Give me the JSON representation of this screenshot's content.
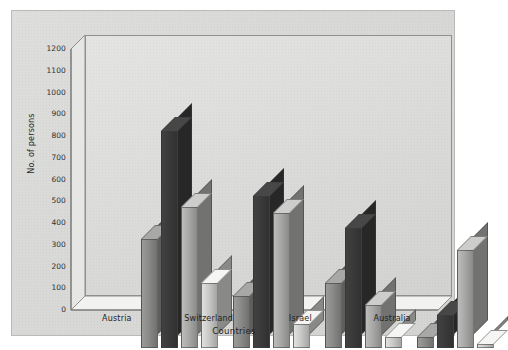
{
  "chart_data": {
    "type": "bar",
    "title": "",
    "xlabel": "Countries",
    "ylabel": "No. of persons",
    "categories": [
      "Austria",
      "Switzerland",
      "Israel",
      "Australia"
    ],
    "series": [
      {
        "name": "series-1",
        "color": "#8a8a88",
        "values": [
          500,
          240,
          300,
          50
        ]
      },
      {
        "name": "series-2",
        "color": "#3a3a3a",
        "values": [
          1000,
          700,
          550,
          150
        ]
      },
      {
        "name": "series-3",
        "color": "#a8a8a6",
        "values": [
          650,
          620,
          200,
          450
        ]
      },
      {
        "name": "series-4",
        "color": "#c9c9c7",
        "values": [
          300,
          110,
          50,
          20
        ]
      }
    ],
    "ylim": [
      0,
      1200
    ],
    "yticks": [
      0,
      100,
      200,
      300,
      400,
      500,
      600,
      700,
      800,
      900,
      1000,
      1100,
      1200
    ],
    "ytick_labels": [
      "0",
      "100",
      "200",
      "300",
      "400",
      "500",
      "600",
      "700",
      "800",
      "900",
      "1000",
      "1100",
      "1200"
    ],
    "grid": false,
    "legend": "none",
    "style": "3d-grouped-bar",
    "background_color": "#d9d9d7",
    "plot_background_color": "#e0e0de",
    "axis_color": "#6f6f6d"
  }
}
